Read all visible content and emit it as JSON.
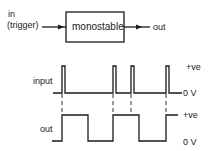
{
  "block": {
    "input_label_1": "in",
    "input_label_2": "(trigger)",
    "box_label": "monostable",
    "output_label": "out"
  },
  "waveforms": {
    "input_label": "input",
    "output_label": "out",
    "high_label_input": "+ve",
    "low_label_input": "0 V",
    "high_label_output": "+ve",
    "low_label_output": "0 V"
  }
}
